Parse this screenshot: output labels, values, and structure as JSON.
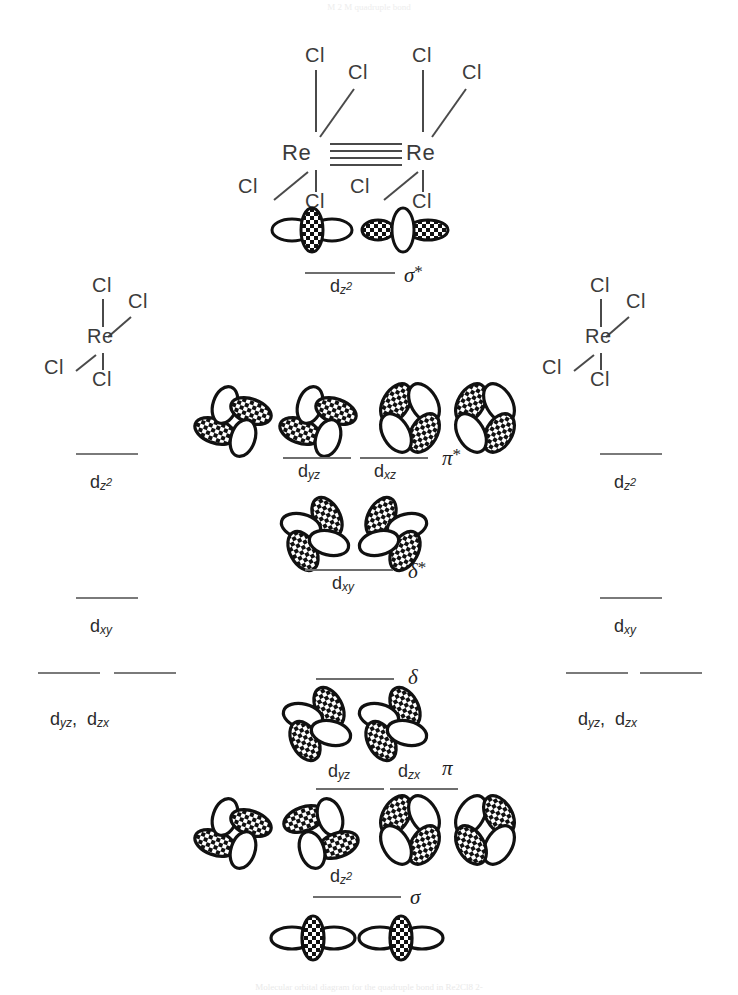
{
  "figure": {
    "top_note": "M  2 M  quadruple bond",
    "bottom_caption": "Molecular orbital diagram for the quadruple bond in Re2Cl8 2-",
    "ink_color": "#1a1a1a",
    "line_color": "#6e6e6e"
  },
  "molecule": {
    "metal_left": "Re",
    "metal_right": "Re",
    "ligand": "Cl",
    "bond_order_lines": 4,
    "left_ligands": [
      "Cl",
      "Cl",
      "Cl",
      "Cl"
    ],
    "right_ligands": [
      "Cl",
      "Cl",
      "Cl",
      "Cl"
    ]
  },
  "fragment_left": {
    "metal": "Re",
    "ligands": [
      "Cl",
      "Cl",
      "Cl",
      "Cl"
    ],
    "levels": [
      {
        "label_d": "d",
        "sub": "z",
        "sup": "2",
        "name": "dz2"
      },
      {
        "label_d": "d",
        "sub": "xy",
        "sup": "",
        "name": "dxy"
      },
      {
        "label_d": "d",
        "sub": "yz,  d",
        "sup": "",
        "name": "dyz-dzx"
      }
    ],
    "level_labels": [
      "d",
      "d",
      "d"
    ],
    "label_dz2": "d",
    "label_dz2_sub": "z",
    "label_dz2_sup": "2",
    "label_dxy": "d",
    "label_dxy_sub": "xy",
    "label_dyzdzx_1": "d",
    "label_dyzdzx_1_sub": "yz",
    "label_comma": ",",
    "label_dyzdzx_2": "d",
    "label_dyzdzx_2_sub": "zx"
  },
  "fragment_right": {
    "metal": "Re",
    "ligands": [
      "Cl",
      "Cl",
      "Cl",
      "Cl"
    ],
    "label_dz2": "d",
    "label_dz2_sub": "z",
    "label_dz2_sup": "2",
    "label_dxy": "d",
    "label_dxy_sub": "xy",
    "label_dyzdzx_1": "d",
    "label_dyzdzx_1_sub": "yz",
    "label_comma": ",",
    "label_dyzdzx_2": "d",
    "label_dyzdzx_2_sub": "zx"
  },
  "mo_levels": [
    {
      "id": "sigma-star",
      "symbol": "σ",
      "star": "*",
      "orbital_label": "d",
      "orbital_sub": "z",
      "orbital_sup": "2",
      "type": "antibonding",
      "parent": "dz2"
    },
    {
      "id": "pi-star",
      "symbol": "π",
      "star": "*",
      "orbital_label_1": "d",
      "orbital_sub_1": "yz",
      "orbital_label_2": "d",
      "orbital_sub_2": "xz",
      "type": "antibonding",
      "parent": "dyz,dxz"
    },
    {
      "id": "delta-star",
      "symbol": "δ",
      "star": "*",
      "orbital_label": "d",
      "orbital_sub": "xy",
      "type": "antibonding",
      "parent": "dxy"
    },
    {
      "id": "delta",
      "symbol": "δ",
      "star": "",
      "orbital_label": "",
      "orbital_sub": "",
      "type": "bonding",
      "parent": "dxy"
    },
    {
      "id": "pi",
      "symbol": "π",
      "star": "",
      "orbital_label_1": "d",
      "orbital_sub_1": "yz",
      "orbital_label_2": "d",
      "orbital_sub_2": "zx",
      "type": "bonding",
      "parent": "dyz,dzx"
    },
    {
      "id": "sigma",
      "symbol": "σ",
      "star": "",
      "orbital_label": "d",
      "orbital_sub": "z",
      "orbital_sup": "2",
      "type": "bonding",
      "parent": "dz2"
    }
  ]
}
